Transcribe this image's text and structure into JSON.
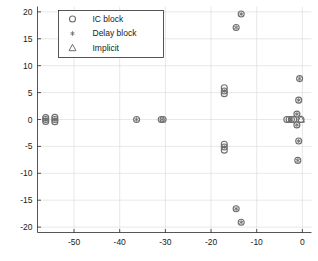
{
  "chart_data": {
    "type": "scatter",
    "title": "",
    "xlabel": "",
    "ylabel": "",
    "xlim": [
      -58,
      2
    ],
    "ylim": [
      -21,
      21
    ],
    "xticks": [
      -50,
      -40,
      -30,
      -20,
      -10,
      0
    ],
    "yticks": [
      -20,
      -15,
      -10,
      -5,
      0,
      5,
      10,
      15,
      20
    ],
    "grid": true,
    "legend_position": "top-left",
    "marker_color": "#6e6e6e",
    "axis_color": "#2b2b2b",
    "grid_color": "#d9d9d9",
    "series": [
      {
        "name": "IC block",
        "marker": "circle",
        "points": [
          [
            -56.2,
            0.0
          ],
          [
            -56.2,
            0.35
          ],
          [
            -56.2,
            -0.35
          ],
          [
            -54.2,
            0.0
          ],
          [
            -54.2,
            0.4
          ],
          [
            -54.2,
            -0.4
          ],
          [
            -36.3,
            0.0
          ],
          [
            -30.9,
            0.0
          ],
          [
            -30.5,
            0.0
          ],
          [
            -17.1,
            5.9
          ],
          [
            -17.1,
            5.3
          ],
          [
            -17.1,
            4.8
          ],
          [
            -17.1,
            -4.6
          ],
          [
            -17.1,
            -5.1
          ],
          [
            -17.1,
            -5.7
          ],
          [
            -13.4,
            19.6
          ],
          [
            -14.5,
            17.1
          ],
          [
            -14.5,
            -16.6
          ],
          [
            -13.4,
            -19.1
          ],
          [
            -0.6,
            7.6
          ],
          [
            -0.8,
            3.6
          ],
          [
            -1.2,
            1.0
          ],
          [
            -3.4,
            0.0
          ],
          [
            -2.9,
            0.0
          ],
          [
            -2.4,
            0.0
          ],
          [
            -1.9,
            0.0
          ],
          [
            -0.3,
            0.0
          ],
          [
            -1.2,
            -1.0
          ],
          [
            -0.8,
            -4.0
          ],
          [
            -1.0,
            -7.6
          ]
        ]
      },
      {
        "name": "Delay block",
        "marker": "asterisk",
        "points": [
          [
            -56.2,
            0.0
          ],
          [
            -54.2,
            0.0
          ],
          [
            -36.3,
            0.0
          ],
          [
            -30.7,
            0.0
          ],
          [
            -17.1,
            5.3
          ],
          [
            -17.1,
            -5.1
          ],
          [
            -13.4,
            19.6
          ],
          [
            -14.5,
            17.1
          ],
          [
            -14.5,
            -16.6
          ],
          [
            -13.4,
            -19.1
          ],
          [
            -0.6,
            7.6
          ],
          [
            -0.8,
            3.6
          ],
          [
            -1.2,
            1.0
          ],
          [
            -2.6,
            0.0
          ],
          [
            -1.2,
            -1.0
          ],
          [
            -0.8,
            -4.0
          ],
          [
            -1.0,
            -7.6
          ]
        ]
      },
      {
        "name": "Implicit",
        "marker": "triangle",
        "points": [
          [
            -0.3,
            0.0
          ]
        ]
      }
    ]
  },
  "legend": {
    "entries": [
      {
        "label": "IC block",
        "marker": "circle"
      },
      {
        "label": "Delay block",
        "marker": "asterisk"
      },
      {
        "label": "Implicit",
        "marker": "triangle"
      }
    ]
  }
}
